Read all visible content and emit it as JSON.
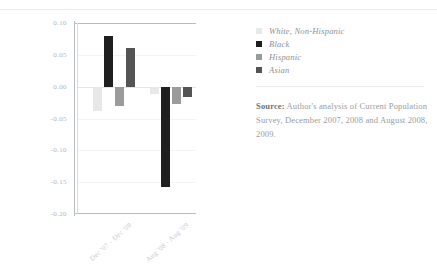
{
  "chart_data": {
    "type": "bar",
    "title": "",
    "subtitle": "",
    "xlabel": "",
    "ylabel": "",
    "categories": [
      "Dec '07 - Dec '08",
      "Aug '08 - Aug '09"
    ],
    "series": [
      {
        "name": "White, Non-Hispanic",
        "color": "#e8e8e8",
        "values": [
          -0.038,
          -0.012
        ]
      },
      {
        "name": "Black",
        "color": "#1f1f1f",
        "values": [
          0.079,
          -0.158
        ]
      },
      {
        "name": "Hispanic",
        "color": "#9b9b9b",
        "values": [
          -0.03,
          -0.028
        ]
      },
      {
        "name": "Asian",
        "color": "#545454",
        "values": [
          0.061,
          -0.016
        ]
      }
    ],
    "ylim": [
      -0.2,
      0.1
    ],
    "yticks": [
      "0.10",
      "0.05",
      "0.00",
      "-0.05",
      "-0.10",
      "-0.15",
      "-0.20"
    ],
    "ytick_values": [
      0.1,
      0.05,
      0.0,
      -0.05,
      -0.1,
      -0.15,
      -0.2
    ],
    "grid": true,
    "legend_position": "right"
  },
  "legend": {
    "items": [
      {
        "label": "White, Non-Hispanic",
        "color": "#e8e8e8"
      },
      {
        "label": "Black",
        "color": "#1f1f1f"
      },
      {
        "label": "Hispanic",
        "color": "#9b9b9b"
      },
      {
        "label": "Asian",
        "color": "#545454"
      }
    ]
  },
  "source": {
    "label": "Source:",
    "text": " Author's analysis of Current Population Survey, December 2007, 2008 and August 2008, 2009."
  }
}
